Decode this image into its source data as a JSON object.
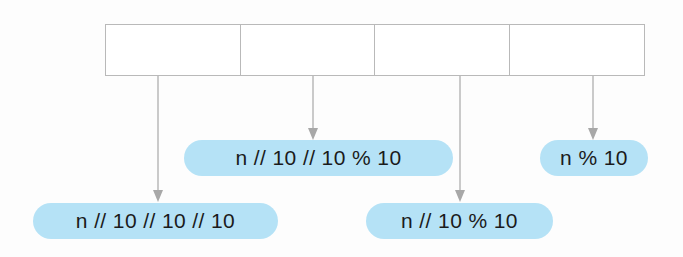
{
  "diagram": {
    "background_color": "#fdfdfd",
    "pill_color": "#b5e2f6",
    "pill_text_color": "#1b1b1b",
    "box_border_color": "#b9b9b9",
    "arrow_color": "#a8a8a8",
    "table": {
      "x": 105,
      "y": 24,
      "width": 540,
      "height": 52,
      "cells": [
        {
          "label": "",
          "x": 105,
          "width": 135
        },
        {
          "label": "",
          "x": 240,
          "width": 135
        },
        {
          "label": "",
          "x": 375,
          "width": 135
        },
        {
          "label": "",
          "x": 510,
          "width": 135
        }
      ]
    },
    "arrows": [
      {
        "name": "arrow-to-thousands",
        "x": 158,
        "y_start": 76,
        "y_end": 202
      },
      {
        "name": "arrow-to-hundreds",
        "x": 313,
        "y_start": 76,
        "y_end": 140
      },
      {
        "name": "arrow-to-tens",
        "x": 460,
        "y_start": 76,
        "y_end": 202
      },
      {
        "name": "arrow-to-ones",
        "x": 593,
        "y_start": 76,
        "y_end": 140
      }
    ],
    "labels": [
      {
        "name": "label-thousands-digit",
        "text": "n // 10 // 10 // 10",
        "x": 33,
        "y": 203,
        "width": 245,
        "height": 36
      },
      {
        "name": "label-hundreds-digit",
        "text": "n  // 10 // 10 % 10",
        "x": 184,
        "y": 140,
        "width": 269,
        "height": 36
      },
      {
        "name": "label-tens-digit",
        "text": "n // 10 % 10",
        "x": 366,
        "y": 203,
        "width": 187,
        "height": 36
      },
      {
        "name": "label-ones-digit",
        "text": "n % 10",
        "x": 540,
        "y": 140,
        "width": 108,
        "height": 36
      }
    ]
  }
}
